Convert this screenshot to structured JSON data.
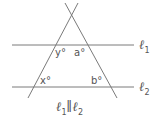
{
  "diagram": {
    "type": "parallel-lines-transversals",
    "stroke_color": "#7a7a7a",
    "text_color": "#555555",
    "lines": {
      "l1": {
        "label": "ℓ",
        "sub": "1"
      },
      "l2": {
        "label": "ℓ",
        "sub": "2"
      }
    },
    "angles": {
      "y": "y°",
      "a": "a°",
      "x": "x°",
      "b": "b°"
    },
    "caption": {
      "left": "ℓ",
      "left_sub": "1",
      "mid": "∥",
      "right": "ℓ",
      "right_sub": "2"
    }
  }
}
